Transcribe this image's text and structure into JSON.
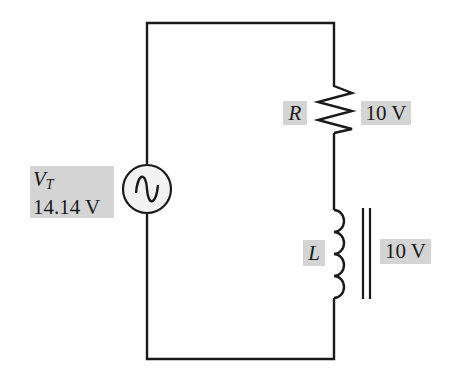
{
  "diagram": {
    "type": "series RL AC circuit",
    "source": {
      "symbol": "V",
      "subscript": "T",
      "value": "14.14 V",
      "icon": "ac-sine-source"
    },
    "resistor": {
      "symbol": "R",
      "voltage": "10 V"
    },
    "inductor": {
      "symbol": "L",
      "voltage": "10 V",
      "core": "iron-core (double line)"
    },
    "colors": {
      "wire": "#1a1a1a",
      "label_background": "#d4d4d4",
      "source_fill": "#f2f2f2"
    }
  }
}
